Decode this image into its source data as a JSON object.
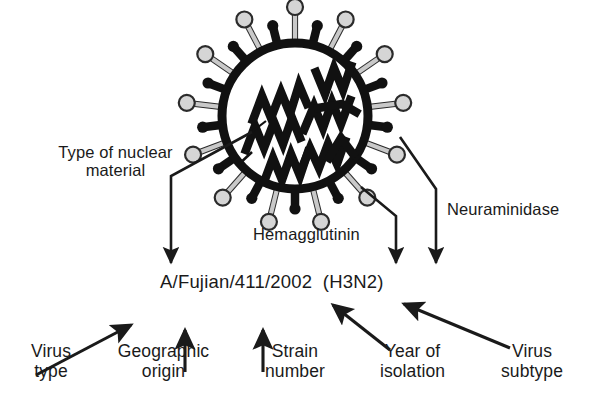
{
  "figure": {
    "strain_name": "A/Fujian/411/2002  (H3N2)",
    "colors": {
      "ink": "#1a1a1a",
      "envelope": "#111111",
      "spike_head_fill": "#d5d5d5",
      "spike_head_stroke": "#2b2b2b",
      "spike_stalk": "#c9c9c9",
      "rna": "#111111",
      "background": "#ffffff"
    },
    "structure_labels": [
      {
        "id": "nuclear",
        "text": "Type of nuclear\nmaterial",
        "points_to": "viral RNA segments"
      },
      {
        "id": "hemagglutinin",
        "text": "Hemagglutinin",
        "points_to": "long gray-headed spike"
      },
      {
        "id": "neuraminidase",
        "text": "Neuraminidase",
        "points_to": "short club spike"
      }
    ],
    "nomenclature_labels": [
      {
        "id": "virus-type",
        "text": "Virus\ntype",
        "refers_to": "A"
      },
      {
        "id": "geographic",
        "text": "Geographic\norigin",
        "refers_to": "Fujian"
      },
      {
        "id": "strain-number",
        "text": "Strain\nnumber",
        "refers_to": "411"
      },
      {
        "id": "year",
        "text": "Year of\nisolation",
        "refers_to": "2002"
      },
      {
        "id": "subtype",
        "text": "Virus\nsubtype",
        "refers_to": "(H3N2)"
      }
    ],
    "virion": {
      "center_x": 295,
      "center_y": 116,
      "envelope_radius": 78,
      "spike_count": 26,
      "rna_segment_count": 8
    }
  }
}
